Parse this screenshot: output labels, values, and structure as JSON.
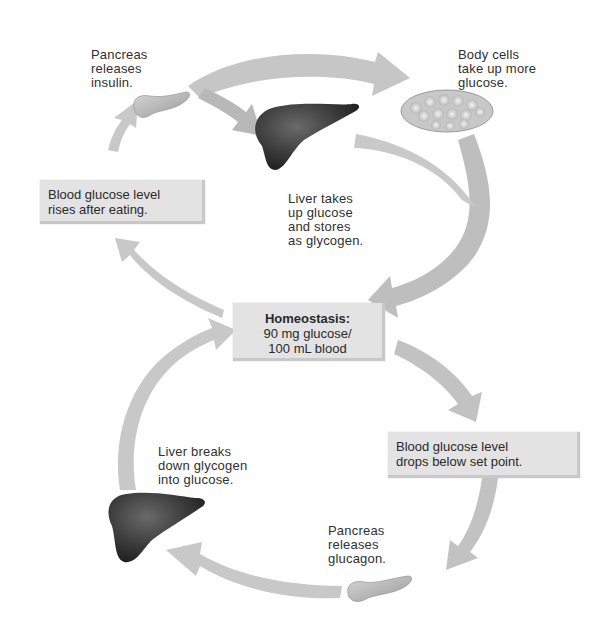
{
  "diagram": {
    "type": "feedback-loop",
    "topic": "Blood glucose homeostasis",
    "center": {
      "title": "Homeostasis:",
      "line1": "90 mg glucose/",
      "line2": "100 mL blood"
    },
    "upper_loop": {
      "stimulus_box": {
        "line1": "Blood glucose level",
        "line2": "rises after eating."
      },
      "pancreas_label": {
        "line1": "Pancreas",
        "line2": "releases",
        "line3": "insulin."
      },
      "body_cells_label": {
        "line1": "Body cells",
        "line2": "take up more",
        "line3": "glucose."
      },
      "liver_label": {
        "line1": "Liver takes",
        "line2": "up glucose",
        "line3": "and stores",
        "line4": "as glycogen."
      }
    },
    "lower_loop": {
      "stimulus_box": {
        "line1": "Blood glucose level",
        "line2": "drops below set point."
      },
      "pancreas_label": {
        "line1": "Pancreas",
        "line2": "releases",
        "line3": "glucagon."
      },
      "liver_label": {
        "line1": "Liver breaks",
        "line2": "down glycogen",
        "line3": "into glucose."
      }
    },
    "colors": {
      "arrow": "#c4c4c4",
      "arrow_dark": "#a9a9a9",
      "box_fill": "#e3e3e3",
      "liver": "#3a3a3a",
      "pancreas": "#bdbdbd",
      "text": "#2a2a2a"
    }
  }
}
